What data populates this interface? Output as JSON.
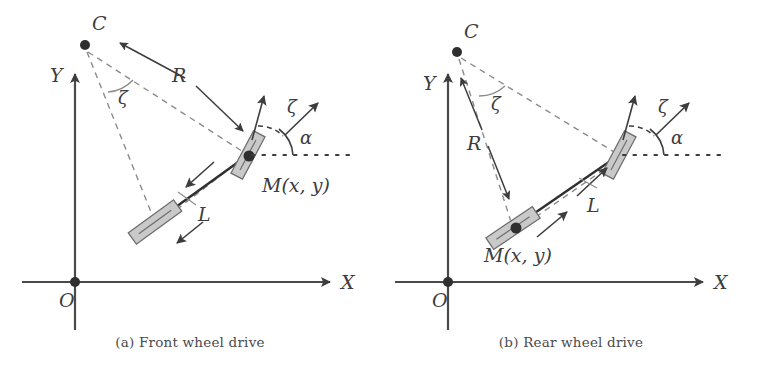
{
  "figure": {
    "type": "technical-diagram",
    "panel_count": 2
  },
  "colors": {
    "ink": "#3d3d3d",
    "axis": "#4a4a4a",
    "dashed": "#8c8c8c",
    "wheel_fill": "#c9c9c9",
    "wheel_stroke": "#6e6e6e",
    "background": "#ffffff",
    "caption": "#4a4a4a"
  },
  "captions": {
    "a": "(a) Front wheel drive",
    "b": "(b) Rear wheel drive"
  },
  "panel_a": {
    "id": "panel-a",
    "title": "Front wheel drive",
    "axes": {
      "x_label": "X",
      "y_label": "Y",
      "origin_label": "O"
    },
    "labels": {
      "center": "C",
      "radius": "R",
      "wheelbase": "L",
      "steer_angle": "ζ",
      "heading_angle": "α",
      "body_angle": "ζ",
      "point": "M(x, y)"
    },
    "geometry": {
      "origin": [
        75,
        282
      ],
      "y_axis_tip": [
        75,
        70
      ],
      "x_axis_tip": [
        332,
        282
      ],
      "center_C": [
        85,
        45
      ],
      "front_wheel": [
        248,
        155
      ],
      "rear_wheel": [
        155,
        222
      ],
      "dotted_line_y": 155,
      "dotted_line_end": 352
    }
  },
  "panel_b": {
    "id": "panel-b",
    "title": "Rear wheel drive",
    "axes": {
      "x_label": "X",
      "y_label": "Y",
      "origin_label": "O"
    },
    "labels": {
      "center": "C",
      "radius": "R",
      "wheelbase": "L",
      "steer_angle": "ζ",
      "heading_angle": "α",
      "body_angle": "ζ",
      "point": "M(x, y)"
    },
    "geometry": {
      "origin": [
        67,
        282
      ],
      "y_axis_tip": [
        67,
        70
      ],
      "x_axis_tip": [
        324,
        282
      ],
      "center_C": [
        76,
        52
      ],
      "front_wheel": [
        238,
        155
      ],
      "rear_wheel": [
        132,
        228
      ],
      "dotted_line_y": 155,
      "dotted_line_end": 344
    }
  }
}
